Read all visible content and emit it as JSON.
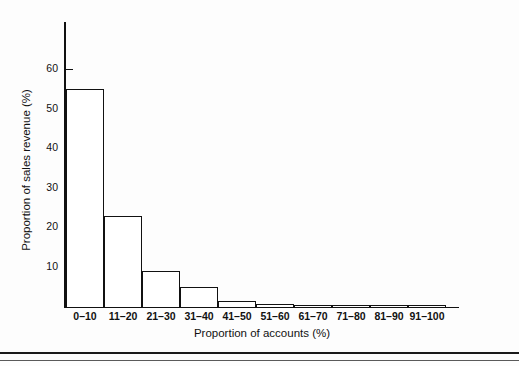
{
  "chart_data": {
    "type": "bar",
    "title": "",
    "subtitle": "",
    "xlabel": "Proportion of accounts (%)",
    "ylabel": "Proportion of sales revenue (%)",
    "categories": [
      "0–10",
      "11–20",
      "21–30",
      "31–40",
      "41–50",
      "51–60",
      "61–70",
      "71–80",
      "81–90",
      "91–100"
    ],
    "values": [
      55,
      23,
      9,
      5,
      1.5,
      0.7,
      0.5,
      0.4,
      0.4,
      0.3
    ],
    "series": [
      {
        "name": "Proportion of sales revenue (%)",
        "values": [
          55,
          23,
          9,
          5,
          1.5,
          0.7,
          0.5,
          0.4,
          0.4,
          0.3
        ]
      }
    ],
    "ylim": [
      0,
      72
    ],
    "xlim": [
      0,
      10
    ],
    "y_ticks": [
      10,
      20,
      30,
      40,
      50,
      60
    ],
    "y_tick_labels": [
      "10",
      "20",
      "30",
      "40",
      "50",
      "60"
    ],
    "grid": false,
    "legend": "none",
    "bar_style": "outline",
    "bar_fill": "#ffffff",
    "bar_edge_color": "#111111",
    "axis_color": "#111111",
    "background": "#fdfdfd"
  },
  "figure": {
    "bottom_rule_color": "#1a1a1a",
    "bottom_rule_thin_color": "#5a5a5a"
  }
}
